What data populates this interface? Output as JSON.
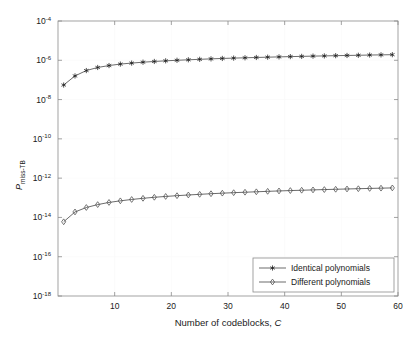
{
  "chart_data": {
    "type": "line",
    "title": "",
    "xlabel": "Number of codeblocks, C",
    "ylabel": "P_miss-TB",
    "ylabel_main": "P",
    "ylabel_subscript": "miss-TB",
    "xlim": [
      0,
      60
    ],
    "ylim": [
      1e-18,
      0.0001
    ],
    "yscale": "log",
    "grid": true,
    "legend_position": "lower right",
    "xticks": [
      10,
      20,
      30,
      40,
      50,
      60
    ],
    "xtick_labels": [
      "10",
      "20",
      "30",
      "40",
      "50",
      "60"
    ],
    "yticks": [
      0.0001,
      1e-06,
      1e-08,
      1e-10,
      1e-12,
      1e-14,
      1e-16,
      1e-18
    ],
    "ytick_labels": [
      "10^-4",
      "10^-6",
      "10^-8",
      "10^-10",
      "10^-12",
      "10^-14",
      "10^-16",
      "10^-18"
    ],
    "ytick_exponents": [
      "-4",
      "-6",
      "-8",
      "-10",
      "-12",
      "-14",
      "-16",
      "-18"
    ],
    "ytick_base": "10",
    "x": [
      1,
      3,
      5,
      7,
      9,
      11,
      13,
      15,
      17,
      19,
      21,
      23,
      25,
      27,
      29,
      31,
      33,
      35,
      37,
      39,
      41,
      43,
      45,
      47,
      49,
      51,
      53,
      55,
      57,
      59
    ],
    "series": [
      {
        "name": "Identical polynomials",
        "marker": "star",
        "values": [
          5.5e-08,
          1.6e-07,
          3e-07,
          4.3e-07,
          5.4e-07,
          6.4e-07,
          7.2e-07,
          8e-07,
          8.7e-07,
          9.4e-07,
          1e-06,
          1.06e-06,
          1.12e-06,
          1.18e-06,
          1.24e-06,
          1.29e-06,
          1.34e-06,
          1.39e-06,
          1.44e-06,
          1.49e-06,
          1.54e-06,
          1.58e-06,
          1.63e-06,
          1.67e-06,
          1.72e-06,
          1.76e-06,
          1.8e-06,
          1.85e-06,
          1.89e-06,
          1.93e-06
        ]
      },
      {
        "name": "Different polynomials",
        "marker": "diamond",
        "values": [
          6e-15,
          1.9e-14,
          3.2e-14,
          4.5e-14,
          5.8e-14,
          7e-14,
          8.2e-14,
          9.4e-14,
          1.06e-13,
          1.17e-13,
          1.28e-13,
          1.39e-13,
          1.5e-13,
          1.61e-13,
          1.72e-13,
          1.82e-13,
          1.92e-13,
          2.02e-13,
          2.13e-13,
          2.23e-13,
          2.33e-13,
          2.42e-13,
          2.52e-13,
          2.62e-13,
          2.71e-13,
          2.81e-13,
          2.9e-13,
          3e-13,
          3.09e-13,
          3.18e-13
        ]
      }
    ]
  },
  "legend": {
    "entries": [
      {
        "label": "Identical polynomials",
        "marker": "star"
      },
      {
        "label": "Different polynomials",
        "marker": "diamond"
      }
    ]
  },
  "colors": {
    "axis": "#8c8c8c",
    "line": "#2b2b2b",
    "grid": "#fafafa",
    "text": "#1a1a1a",
    "background": "#ffffff"
  }
}
